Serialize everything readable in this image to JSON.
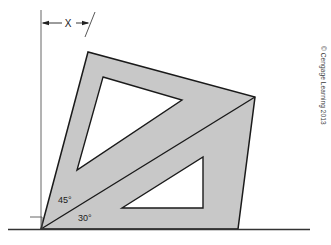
{
  "figure": {
    "type": "technical-line-drawing",
    "background_color": "#ffffff",
    "body_fill_color": "#c8c8c8",
    "outline_color": "#1a1a1a",
    "cutout_fill_color": "#ffffff",
    "baseline_color": "#333333"
  },
  "dimension": {
    "label": "X",
    "description": "horizontal offset from vertical reference line to the dimension tick",
    "arrow_left": "arrow-left",
    "arrow_right": "arrow-right"
  },
  "angles": {
    "upper": {
      "label": "45°",
      "value": 45,
      "unit": "degrees"
    },
    "lower": {
      "label": "30°",
      "value": 30,
      "unit": "degrees"
    }
  },
  "markers": {
    "right_angle": "right-angle-square-marker",
    "vertical_reference": "vertical-reference-line",
    "baseline": "horizontal-base-line"
  },
  "credit": {
    "text": "© Cengage Learning 2013"
  },
  "geometry": {
    "outer_triangle_points": "41,229 88,52 255,97 238,229",
    "upper_cutout_points": "103,77 182,100 77,170",
    "lower_cutout_points": "203,157 203,208 122,208",
    "pivot_point": "41,229",
    "top_vertex": "88,52",
    "right_apex": "255,97",
    "bottom_right": "238,229"
  }
}
